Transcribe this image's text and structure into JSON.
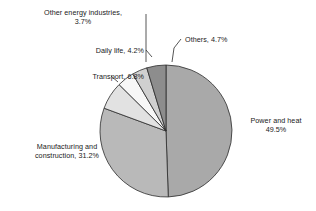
{
  "chart_data": {
    "type": "pie",
    "title": "",
    "subtitle": "",
    "xlabel": "",
    "ylabel": "",
    "legend_position": "none",
    "labels_inline": true,
    "unit": "%",
    "categories": [
      "Power and heat",
      "Manufacturing and construction",
      "Transport",
      "Daily life",
      "Other energy industries",
      "Others"
    ],
    "values": [
      49.5,
      31.2,
      6.8,
      4.2,
      3.7,
      4.7
    ],
    "colors": [
      "#a9a9a9",
      "#b9b9b9",
      "#e2e2e2",
      "#f7f7f7",
      "#d0d0d0",
      "#8d8d8d"
    ],
    "start_angle_deg": 0,
    "direction": "clockwise",
    "slices": [
      {
        "name": "Power and heat",
        "value": 49.5,
        "label": "Power and heat",
        "value_label": "49.5%",
        "label_line1": "Power and heat",
        "label_line2": "49.5%",
        "color": "#a9a9a9"
      },
      {
        "name": "Manufacturing and construction",
        "value": 31.2,
        "label": "Manufacturing and construction",
        "value_label": "31.2%",
        "label_line1": "Manufacturing and",
        "label_line2": "construction, 31.2%",
        "color": "#b9b9b9"
      },
      {
        "name": "Transport",
        "value": 6.8,
        "label": "Transport",
        "value_label": "6.8%",
        "label_line1": "Transport, 6.8%",
        "label_line2": "",
        "color": "#e2e2e2"
      },
      {
        "name": "Daily life",
        "value": 4.2,
        "label": "Daily life",
        "value_label": "4.2%",
        "label_line1": "Daily life, 4.2%",
        "label_line2": "",
        "color": "#f7f7f7"
      },
      {
        "name": "Other energy industries",
        "value": 3.7,
        "label": "Other energy industries",
        "value_label": "3.7%",
        "label_line1": "Other energy industries,",
        "label_line2": "3.7%",
        "color": "#d0d0d0"
      },
      {
        "name": "Others",
        "value": 4.7,
        "label": "Others",
        "value_label": "4.7%",
        "label_line1": "Others, 4.7%",
        "label_line2": "",
        "color": "#8d8d8d"
      }
    ]
  },
  "style": {
    "background": "#ffffff",
    "outline": "#2b2b2b",
    "text": "#1a1a1a",
    "leader": "#2b2b2b"
  }
}
